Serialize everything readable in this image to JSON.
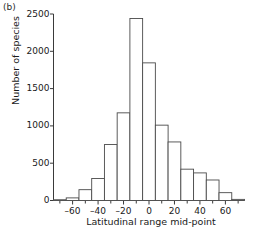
{
  "figure": {
    "panel_label": "(b)",
    "xlabel": "Latitudinal range mid-point",
    "ylabel": "Number of species"
  },
  "chart_data": {
    "type": "bar",
    "title": "",
    "subtitle": "",
    "panel": "(b)",
    "xlabel": "Latitudinal range mid-point",
    "ylabel": "Number of species",
    "xlim": [
      -75,
      75
    ],
    "ylim": [
      0,
      2500
    ],
    "bin_width": 10,
    "grid": false,
    "legend": null,
    "xticks": [
      -60,
      -40,
      -20,
      0,
      20,
      40,
      60
    ],
    "xtick_labels": [
      "–60",
      "–40",
      "–20",
      "0",
      "20",
      "40",
      "60"
    ],
    "yticks": [
      0,
      500,
      1000,
      1500,
      2000,
      2500
    ],
    "ytick_labels": [
      "0",
      "500",
      "1000",
      "1500",
      "2000",
      "2500"
    ],
    "minor_xticks": [
      -70,
      -50,
      -30,
      -10,
      10,
      30,
      50,
      70
    ],
    "categories": [
      -70,
      -60,
      -50,
      -40,
      -30,
      -20,
      -10,
      0,
      10,
      20,
      30,
      40,
      50,
      60,
      70
    ],
    "bin_edges": [
      -75,
      -65,
      -55,
      -45,
      -35,
      -25,
      -15,
      -5,
      5,
      15,
      25,
      35,
      45,
      55,
      65,
      75
    ],
    "values": [
      10,
      35,
      145,
      295,
      750,
      1175,
      2440,
      1845,
      1010,
      785,
      420,
      370,
      275,
      105,
      15
    ],
    "annotations": []
  }
}
